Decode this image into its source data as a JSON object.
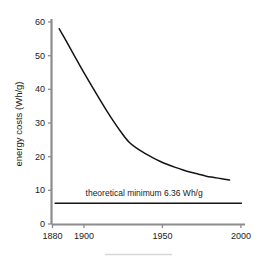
{
  "chart_data": {
    "type": "line",
    "title": "",
    "xlabel": "",
    "ylabel": "energy costs (Wh/g)",
    "xlim": [
      1880,
      2005
    ],
    "ylim": [
      0,
      63
    ],
    "xticks": [
      1880,
      1900,
      1950,
      2000
    ],
    "xtick_labels": [
      "1880",
      "1900",
      "1950",
      "2000"
    ],
    "yticks": [
      0,
      10,
      20,
      30,
      40,
      50,
      60
    ],
    "ytick_labels": [
      "0",
      "10",
      "20",
      "30",
      "40",
      "50",
      "60"
    ],
    "grid": false,
    "legend": false,
    "series": [
      {
        "name": "energy costs",
        "x": [
          1885,
          1890,
          1895,
          1900,
          1905,
          1910,
          1915,
          1920,
          1925,
          1930,
          1935,
          1940,
          1945,
          1950,
          1955,
          1960,
          1965,
          1970,
          1975,
          1980,
          1985,
          1990,
          1995
        ],
        "values": [
          60.0,
          55.8,
          51.5,
          47.3,
          43.2,
          39.2,
          35.3,
          31.6,
          28.2,
          25.2,
          23.3,
          21.8,
          20.5,
          19.3,
          18.3,
          17.4,
          16.6,
          15.9,
          15.3,
          14.7,
          14.3,
          13.9,
          13.5
        ]
      }
    ],
    "annotations": [
      {
        "name": "theoretical-minimum",
        "label": "theoretical minimum 6.36 Wh/g",
        "value": 6.36,
        "x_start": 1882,
        "x_end": 2003,
        "label_x": 1902,
        "label_y": 8.6
      }
    ]
  },
  "footer": {
    "rule": true
  }
}
